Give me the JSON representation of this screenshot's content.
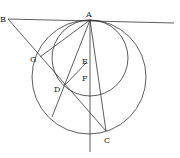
{
  "diagram": {
    "labels": {
      "A": "A",
      "B": "B",
      "C": "C",
      "D": "D",
      "E": "E",
      "F": "F",
      "G": "G"
    },
    "points": {
      "A": [
        90,
        20
      ],
      "B": [
        8,
        19
      ],
      "C": [
        106,
        131
      ],
      "D": [
        65,
        85
      ],
      "E": [
        87,
        60
      ],
      "F": [
        87,
        77
      ],
      "G": [
        40,
        57
      ]
    },
    "circles": [
      {
        "name": "large-circle",
        "center": [
          89,
          77
        ],
        "r": 56
      },
      {
        "name": "small-circle",
        "center": [
          90,
          58
        ],
        "r": 38
      }
    ],
    "line_color": "#333333"
  }
}
